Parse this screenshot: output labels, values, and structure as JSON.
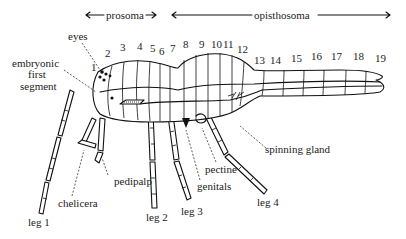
{
  "figure": {
    "colors": {
      "ink": "#111111",
      "text": "#222222",
      "background": "#ffffff"
    }
  },
  "regions": {
    "prosoma": "prosoma",
    "opisthosoma": "opisthosoma"
  },
  "segments": [
    "1",
    "2",
    "3",
    "4",
    "5",
    "6",
    "7",
    "8",
    "9",
    "10",
    "11",
    "12",
    "13",
    "14",
    "15",
    "16",
    "17",
    "18",
    "19"
  ],
  "labels": {
    "eyes": "eyes",
    "embryonic_line1": "embryonic",
    "embryonic_line2": "first",
    "embryonic_line3": "segment",
    "spinning_gland": "spinning gland",
    "pedipalp": "pedipalp",
    "pectine": "pectine",
    "chelicera": "chelicera",
    "genitals": "genitals",
    "leg1": "leg 1",
    "leg2": "leg 2",
    "leg3": "leg 3",
    "leg4": "leg 4"
  }
}
